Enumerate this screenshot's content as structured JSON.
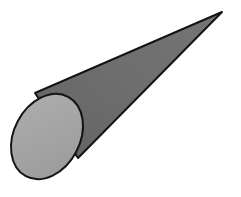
{
  "figure": {
    "shape_name": "cone",
    "caption": "",
    "background_color": "#ffffff",
    "canvas": {
      "width": 241,
      "height": 197
    }
  },
  "geometry": {
    "apex": {
      "x": 222,
      "y": 12
    },
    "base_ellipse": {
      "center_x": 47,
      "center_y": 136.5,
      "radius_x": 33,
      "radius_y": 45,
      "rotation_deg": 28,
      "bounds": {
        "left": 14,
        "top": 92,
        "right": 80,
        "bottom": 181
      }
    },
    "tangent_upper": {
      "x": 35,
      "y": 93
    },
    "tangent_lower": {
      "x": 78,
      "y": 158
    },
    "body_path": "M 35 93 L 222 12 L 78 158",
    "ellipse_path": "M 14 136.5 A 33 45 28 1 1 80 136.5 A 33 45 28 1 1 14 136.5"
  },
  "style": {
    "body_fill": "#6b6b6b",
    "body_fill_light": "#757575",
    "face_fill": "#a3a3a3",
    "face_fill_light": "#ababab",
    "stroke_color": "#141414",
    "stroke_width": 2,
    "dither_opacity": 0.06
  },
  "labels": {
    "apex_label": "",
    "base_label": "",
    "axis_label": "",
    "height_label": "",
    "radius_label": ""
  }
}
